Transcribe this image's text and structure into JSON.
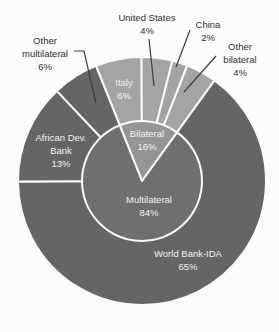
{
  "chart_data": {
    "type": "pie",
    "subtype": "nested-donut",
    "units": "percent",
    "start_angle_deg": -21.8,
    "inner_series": [
      {
        "name": "Bilateral",
        "value": 16,
        "pct_label": "16%"
      },
      {
        "name": "Multilateral",
        "value": 84,
        "pct_label": "84%"
      }
    ],
    "outer_series": [
      {
        "name": "Italy",
        "value": 6,
        "pct_label": "6%",
        "group": "bilateral",
        "label_position": "inside"
      },
      {
        "name": "United States",
        "value": 4,
        "pct_label": "4%",
        "group": "bilateral",
        "label_position": "outside"
      },
      {
        "name": "China",
        "value": 2,
        "pct_label": "2%",
        "group": "bilateral",
        "label_position": "outside"
      },
      {
        "name": "Other bilateral",
        "value": 4,
        "pct_label": "4%",
        "group": "bilateral",
        "label_position": "outside"
      },
      {
        "name": "World Bank-IDA",
        "value": 65,
        "pct_label": "65%",
        "group": "multilateral",
        "label_position": "inside"
      },
      {
        "name": "African Dev. Bank",
        "value": 13,
        "pct_label": "13%",
        "group": "multilateral",
        "label_position": "inside"
      },
      {
        "name": "Other multilateral",
        "value": 6,
        "pct_label": "6%",
        "group": "multilateral",
        "label_position": "outside"
      }
    ],
    "colors": {
      "bilateral_outer": "#a4a4a4",
      "bilateral_inner": "#959595",
      "multilateral_outer": "#656565",
      "multilateral_inner": "#6f6f6f",
      "separator": "#fafafa",
      "inside_label_text": "#f2f2f2",
      "outside_label_text": "#2e2e2e",
      "leader_line": "#3c3c3c",
      "background": "#fcfcfc"
    },
    "legend": "none"
  }
}
